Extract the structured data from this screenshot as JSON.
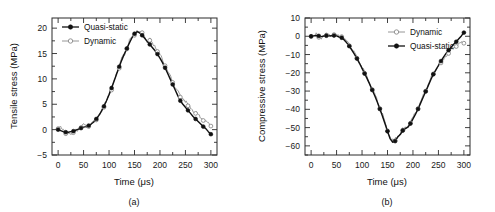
{
  "figure": {
    "background": "#ffffff",
    "series_colors": {
      "quasi_static": "#111111",
      "dynamic": "#8a8a8a"
    }
  },
  "panels": [
    {
      "id": "a",
      "caption": "(a)",
      "xlabel": "Time (μs)",
      "ylabel": "Tensile stress (MPa)",
      "xticks": [
        "0",
        "50",
        "100",
        "150",
        "200",
        "250",
        "300"
      ],
      "yticks": [
        "-5",
        "0",
        "5",
        "10",
        "15",
        "20"
      ],
      "legend": [
        {
          "label": "Quasi-static",
          "marker": "filled-circle"
        },
        {
          "label": "Dynamic",
          "marker": "open-circle"
        }
      ]
    },
    {
      "id": "b",
      "caption": "(b)",
      "xlabel": "Time (μs)",
      "ylabel": "Compressive stress (MPa)",
      "xticks": [
        "0",
        "50",
        "100",
        "150",
        "200",
        "250",
        "300"
      ],
      "yticks": [
        "-60",
        "-50",
        "-40",
        "-30",
        "-20",
        "-10",
        "0",
        "10"
      ],
      "legend": [
        {
          "label": "Dynamic",
          "marker": "open-circle"
        },
        {
          "label": "Quasi-static",
          "marker": "filled-circle"
        }
      ]
    }
  ],
  "chart_data": [
    {
      "type": "line",
      "panel": "a",
      "title": "",
      "xlabel": "Time (μs)",
      "ylabel": "Tensile stress (MPa)",
      "xlim": [
        -12,
        312
      ],
      "ylim": [
        -5,
        22
      ],
      "xticks": [
        0,
        50,
        100,
        150,
        200,
        250,
        300
      ],
      "yticks": [
        -5,
        0,
        5,
        10,
        15,
        20
      ],
      "grid": false,
      "legend_position": "top-left",
      "series": [
        {
          "name": "Quasi-static",
          "marker": "filled-circle",
          "x": [
            0,
            5,
            10,
            15,
            20,
            25,
            30,
            35,
            40,
            45,
            50,
            55,
            60,
            65,
            70,
            75,
            80,
            85,
            90,
            95,
            100,
            105,
            110,
            115,
            120,
            125,
            130,
            135,
            140,
            145,
            150,
            155,
            160,
            165,
            170,
            175,
            180,
            185,
            190,
            195,
            200,
            205,
            210,
            215,
            220,
            225,
            230,
            235,
            240,
            245,
            250,
            255,
            260,
            265,
            270,
            275,
            280,
            285,
            290,
            295,
            300
          ],
          "y": [
            0.0,
            -0.2,
            -0.4,
            -0.5,
            -0.5,
            -0.4,
            -0.3,
            -0.1,
            0.1,
            0.3,
            0.5,
            0.6,
            0.8,
            1.1,
            1.5,
            2.1,
            2.8,
            3.6,
            4.6,
            5.7,
            6.9,
            8.2,
            9.6,
            11.0,
            12.4,
            13.7,
            14.9,
            16.0,
            17.1,
            18.1,
            18.9,
            19.3,
            19.1,
            18.6,
            18.0,
            17.4,
            16.8,
            16.2,
            15.6,
            14.9,
            14.1,
            13.2,
            12.2,
            11.1,
            10.0,
            8.9,
            7.8,
            6.7,
            5.7,
            5.0,
            4.4,
            3.8,
            3.2,
            2.6,
            2.1,
            1.6,
            1.1,
            0.6,
            0.2,
            -0.4,
            -0.9
          ]
        },
        {
          "name": "Dynamic",
          "marker": "open-circle",
          "x": [
            0,
            5,
            10,
            15,
            20,
            25,
            30,
            35,
            40,
            45,
            50,
            55,
            60,
            65,
            70,
            75,
            80,
            85,
            90,
            95,
            100,
            105,
            110,
            115,
            120,
            125,
            130,
            135,
            140,
            145,
            150,
            155,
            160,
            165,
            170,
            175,
            180,
            185,
            190,
            195,
            200,
            205,
            210,
            215,
            220,
            225,
            230,
            235,
            240,
            245,
            250,
            255,
            260,
            265,
            270,
            275,
            280,
            285,
            290,
            295,
            300
          ],
          "y": [
            0.2,
            0.6,
            -0.3,
            -0.8,
            -0.6,
            -0.9,
            -0.6,
            -0.4,
            0.0,
            0.4,
            0.9,
            0.4,
            0.6,
            1.0,
            1.4,
            1.9,
            2.6,
            3.4,
            4.4,
            5.6,
            6.9,
            7.8,
            9.4,
            11.2,
            12.1,
            13.9,
            14.6,
            15.9,
            17.3,
            18.0,
            18.6,
            19.4,
            18.8,
            19.1,
            18.2,
            17.1,
            17.6,
            16.9,
            16.4,
            15.4,
            14.6,
            13.6,
            12.6,
            11.3,
            10.4,
            9.3,
            8.1,
            7.4,
            6.4,
            6.1,
            5.4,
            4.7,
            4.3,
            3.6,
            3.2,
            2.7,
            2.3,
            1.8,
            1.4,
            1.0,
            0.7
          ]
        }
      ]
    },
    {
      "type": "line",
      "panel": "b",
      "title": "",
      "xlabel": "Time (μs)",
      "ylabel": "Compressive stress (MPa)",
      "xlim": [
        -12,
        312
      ],
      "ylim": [
        -65,
        10
      ],
      "xticks": [
        0,
        50,
        100,
        150,
        200,
        250,
        300
      ],
      "yticks": [
        -60,
        -50,
        -40,
        -30,
        -20,
        -10,
        0,
        10
      ],
      "grid": false,
      "legend_position": "top-right",
      "series": [
        {
          "name": "Dynamic",
          "marker": "open-circle",
          "x": [
            0,
            5,
            10,
            15,
            20,
            25,
            30,
            35,
            40,
            45,
            50,
            55,
            60,
            65,
            70,
            75,
            80,
            85,
            90,
            95,
            100,
            105,
            110,
            115,
            120,
            125,
            130,
            135,
            140,
            145,
            150,
            155,
            160,
            165,
            170,
            175,
            180,
            185,
            190,
            195,
            200,
            205,
            210,
            215,
            220,
            225,
            230,
            235,
            240,
            245,
            250,
            255,
            260,
            265,
            270,
            275,
            280,
            285,
            290,
            295,
            300
          ],
          "y": [
            -0.2,
            0.4,
            0.8,
            -0.6,
            -1.2,
            0.3,
            0.6,
            -0.3,
            0.4,
            0.9,
            0.2,
            -0.6,
            -0.2,
            -1.8,
            -3.4,
            -5.2,
            -7.4,
            -9.6,
            -12.0,
            -14.6,
            -17.4,
            -20.2,
            -23.0,
            -26.0,
            -29.2,
            -32.4,
            -35.8,
            -39.6,
            -43.4,
            -47.6,
            -51.8,
            -55.6,
            -57.8,
            -57.2,
            -55.0,
            -53.6,
            -51.4,
            -50.4,
            -49.6,
            -47.6,
            -45.0,
            -42.4,
            -39.6,
            -36.4,
            -33.2,
            -30.0,
            -26.8,
            -23.6,
            -20.6,
            -18.6,
            -16.6,
            -14.6,
            -12.6,
            -11.0,
            -9.4,
            -8.0,
            -6.6,
            -5.6,
            -4.8,
            -4.2,
            -3.8
          ]
        },
        {
          "name": "Quasi-static",
          "marker": "filled-circle",
          "x": [
            0,
            5,
            10,
            15,
            20,
            25,
            30,
            35,
            40,
            45,
            50,
            55,
            60,
            65,
            70,
            75,
            80,
            85,
            90,
            95,
            100,
            105,
            110,
            115,
            120,
            125,
            130,
            135,
            140,
            145,
            150,
            155,
            160,
            165,
            170,
            175,
            180,
            185,
            190,
            195,
            200,
            205,
            210,
            215,
            220,
            225,
            230,
            235,
            240,
            245,
            250,
            255,
            260,
            265,
            270,
            275,
            280,
            285,
            290,
            295,
            300
          ],
          "y": [
            0.0,
            0.2,
            0.4,
            0.2,
            -0.2,
            0.1,
            0.3,
            0.2,
            0.3,
            0.4,
            0.2,
            -0.4,
            -0.8,
            -2.0,
            -3.6,
            -5.4,
            -7.6,
            -9.8,
            -12.2,
            -14.8,
            -17.6,
            -20.4,
            -23.2,
            -26.2,
            -29.4,
            -32.6,
            -36.0,
            -39.8,
            -43.6,
            -47.8,
            -52.0,
            -56.0,
            -58.0,
            -57.4,
            -55.2,
            -53.8,
            -51.6,
            -50.6,
            -49.8,
            -47.8,
            -45.2,
            -42.6,
            -39.8,
            -36.6,
            -33.4,
            -30.2,
            -27.0,
            -23.8,
            -20.8,
            -18.4,
            -16.0,
            -13.6,
            -11.4,
            -9.4,
            -7.6,
            -6.0,
            -4.4,
            -3.0,
            -1.4,
            0.2,
            2.0
          ]
        }
      ]
    }
  ]
}
